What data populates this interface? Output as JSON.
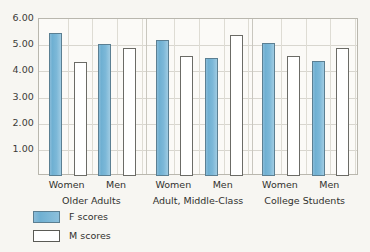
{
  "chart_data": {
    "type": "bar",
    "title": "",
    "subtitle": "",
    "xlabel": "",
    "ylabel": "",
    "ylim": [
      0.0,
      6.0
    ],
    "ytick_labels": [
      "6.00",
      "5.00",
      "4.00",
      "3.00",
      "2.00",
      "1.00"
    ],
    "ytick_values": [
      6.0,
      5.0,
      4.0,
      3.0,
      2.0,
      1.0
    ],
    "grid": true,
    "legend_position": "below-left",
    "legend": [
      {
        "name": "F scores",
        "color": "#7cb8d8"
      },
      {
        "name": "M scores",
        "color": "#ffffff"
      }
    ],
    "groups": [
      {
        "label": "Older Adults",
        "subgroups": [
          {
            "label": "Women",
            "F": 5.45,
            "M": 4.35
          },
          {
            "label": "Men",
            "F": 5.05,
            "M": 4.9
          }
        ]
      },
      {
        "label": "Adult, Middle-Class",
        "subgroups": [
          {
            "label": "Women",
            "F": 5.2,
            "M": 4.6
          },
          {
            "label": "Men",
            "F": 4.5,
            "M": 5.4
          }
        ]
      },
      {
        "label": "College Students",
        "subgroups": [
          {
            "label": "Women",
            "F": 5.07,
            "M": 4.58
          },
          {
            "label": "Men",
            "F": 4.4,
            "M": 4.9
          }
        ]
      }
    ],
    "categories": [
      "Older Adults - Women",
      "Older Adults - Men",
      "Adult, Middle-Class - Women",
      "Adult, Middle-Class - Men",
      "College Students - Women",
      "College Students - Men"
    ],
    "series": [
      {
        "name": "F scores",
        "values": [
          5.45,
          5.05,
          5.2,
          4.5,
          5.07,
          4.4
        ]
      },
      {
        "name": "M scores",
        "values": [
          4.35,
          4.9,
          4.6,
          5.4,
          4.58,
          4.9
        ]
      }
    ],
    "colors": {
      "f_bar": "#7cb8d8",
      "f_bar_border": "#5b7f92",
      "m_bar": "#ffffff",
      "m_bar_border": "#6b6b66",
      "grid": "#d8d6cf",
      "frame": "#b9b7ae",
      "background": "#f7f6f2",
      "plot_background": "#fbfaf7",
      "text": "#31312e"
    }
  }
}
